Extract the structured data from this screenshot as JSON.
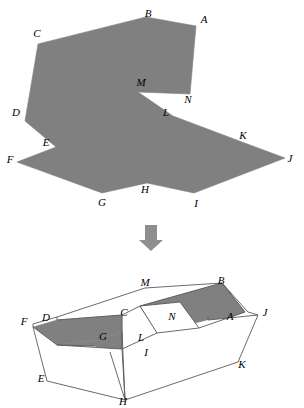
{
  "figure": {
    "colors": {
      "fill_gray": "#808080",
      "fill_gray_dark": "#767676",
      "fill_white": "#ffffff",
      "stroke": "#595959",
      "label": "#000000",
      "arrow": "#8e8e8e",
      "background": "#ffffff"
    },
    "top_diagram": {
      "name": "flat-net",
      "outline_points": "38,44 146,17 196,26 190,94 138,92 173,116 242,142 285,158 194,193 147,183 102,193 17,162 56,147 25,121",
      "labels": [
        {
          "id": "A",
          "text": "A",
          "x": 204,
          "y": 20
        },
        {
          "id": "B",
          "text": "B",
          "x": 148,
          "y": 14
        },
        {
          "id": "C",
          "text": "C",
          "x": 37,
          "y": 34
        },
        {
          "id": "D",
          "text": "D",
          "x": 16,
          "y": 113
        },
        {
          "id": "E",
          "text": "E",
          "x": 46,
          "y": 143
        },
        {
          "id": "F",
          "text": "F",
          "x": 10,
          "y": 160
        },
        {
          "id": "G",
          "text": "G",
          "x": 102,
          "y": 203
        },
        {
          "id": "H",
          "text": "H",
          "x": 145,
          "y": 190
        },
        {
          "id": "I",
          "text": "I",
          "x": 196,
          "y": 204
        },
        {
          "id": "J",
          "text": "J",
          "x": 290,
          "y": 159
        },
        {
          "id": "K",
          "text": "K",
          "x": 243,
          "y": 136
        },
        {
          "id": "L",
          "text": "L",
          "x": 166,
          "y": 113
        },
        {
          "id": "M",
          "text": "M",
          "x": 141,
          "y": 83
        },
        {
          "id": "N",
          "text": "N",
          "x": 188,
          "y": 100
        }
      ]
    },
    "arrow": {
      "name": "downward-arrow",
      "points": "145,225 157,225 157,240 163,240 151,251 139,240 145,240"
    },
    "bottom_diagram": {
      "name": "folded-solid",
      "faces": [
        {
          "id": "top-left-white",
          "fill": "white",
          "points": "33,324 57,317 145,288 222,283 248,312 208,317 122,315 57,320"
        },
        {
          "id": "back-top-white",
          "fill": "white",
          "points": "57,317 145,288 222,283 140,306 122,315"
        },
        {
          "id": "gray-band-right",
          "fill": "gray",
          "points": "222,283 245,312 199,328 157,333 140,306"
        },
        {
          "id": "white-notch-N",
          "fill": "white",
          "points": "140,306 157,333 199,328 180,302"
        },
        {
          "id": "gray-flap-left",
          "fill": "gray",
          "points": "33,327 57,320 122,315 122,331 100,340 57,345"
        },
        {
          "id": "gray-tail-H",
          "fill": "gray",
          "points": "57,345 100,340 122,331 122,349 125,400 110,352 95,346"
        },
        {
          "id": "front-white",
          "fill": "white",
          "points": "33,327 57,345 122,349 125,400 47,381"
        },
        {
          "id": "right-white",
          "fill": "white",
          "points": "125,400 238,362 258,315 208,320 157,333 122,349"
        }
      ],
      "edges": [
        "33,324 57,317",
        "57,317 145,288",
        "145,288 222,283",
        "222,283 248,312",
        "248,312 258,315",
        "33,324 33,327",
        "57,317 57,320",
        "57,320 122,315",
        "122,315 140,306",
        "140,306 222,283",
        "140,306 157,333",
        "157,333 199,328",
        "199,328 180,302",
        "180,302 140,306",
        "222,283 245,312",
        "245,312 199,328",
        "208,317 208,320",
        "122,315 122,349",
        "33,327 47,381",
        "47,381 125,400",
        "125,400 238,362",
        "238,362 258,315",
        "33,327 57,345",
        "57,345 122,349",
        "122,349 125,400",
        "125,400 110,352",
        "57,345 95,346",
        "122,331 125,400",
        "157,333 122,349",
        "208,320 258,315"
      ],
      "labels": [
        {
          "id": "M",
          "text": "M",
          "x": 145,
          "y": 283
        },
        {
          "id": "B",
          "text": "B",
          "x": 221,
          "y": 281
        },
        {
          "id": "F",
          "text": "F",
          "x": 24,
          "y": 322
        },
        {
          "id": "D",
          "text": "D",
          "x": 46,
          "y": 318
        },
        {
          "id": "C",
          "text": "C",
          "x": 124,
          "y": 313
        },
        {
          "id": "N",
          "text": "N",
          "x": 172,
          "y": 317
        },
        {
          "id": "A",
          "text": "A",
          "x": 230,
          "y": 317
        },
        {
          "id": "J",
          "text": "J",
          "x": 265,
          "y": 313
        },
        {
          "id": "G",
          "text": "G",
          "x": 103,
          "y": 337
        },
        {
          "id": "L",
          "text": "L",
          "x": 141,
          "y": 338
        },
        {
          "id": "I",
          "text": "I",
          "x": 146,
          "y": 353
        },
        {
          "id": "K",
          "text": "K",
          "x": 242,
          "y": 365
        },
        {
          "id": "E",
          "text": "E",
          "x": 41,
          "y": 379
        },
        {
          "id": "H",
          "text": "H",
          "x": 123,
          "y": 402
        }
      ]
    }
  }
}
